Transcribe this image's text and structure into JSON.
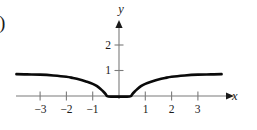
{
  "figure": {
    "panel_label": ")",
    "background_color": "#ffffff",
    "curve_color": "#0a0a0a",
    "axis_color": "#7b7b7b",
    "text_color": "#1a1a1a"
  },
  "chart_data": {
    "type": "line",
    "title": "",
    "xlabel": "x",
    "ylabel": "y",
    "grid": false,
    "legend": null,
    "xlim": [
      -3.9,
      4.3
    ],
    "ylim": [
      -0.5,
      2.9
    ],
    "x_ticks": [
      -3,
      -2,
      -1,
      1,
      2,
      3
    ],
    "x_tick_labels": [
      "−3",
      "−2",
      "−1",
      "1",
      "2",
      "3"
    ],
    "y_ticks": [
      1,
      2
    ],
    "y_tick_labels": [
      "1",
      "2"
    ],
    "series": [
      {
        "name": "curve",
        "x": [
          -3.9,
          -3.5,
          -3.0,
          -2.5,
          -2.0,
          -1.75,
          -1.5,
          -1.25,
          -1.0,
          -0.85,
          -0.7,
          -0.6,
          -0.5,
          -0.45,
          -0.3,
          0.0,
          0.3,
          0.45,
          0.5,
          0.6,
          0.7,
          0.85,
          1.0,
          1.25,
          1.5,
          1.75,
          2.0,
          2.5,
          3.0,
          3.5,
          3.9
        ],
        "y": [
          0.88,
          0.87,
          0.86,
          0.83,
          0.78,
          0.73,
          0.67,
          0.59,
          0.5,
          0.42,
          0.3,
          0.2,
          0.09,
          0.02,
          0.0,
          0.0,
          0.0,
          0.02,
          0.09,
          0.2,
          0.3,
          0.42,
          0.5,
          0.59,
          0.67,
          0.73,
          0.78,
          0.83,
          0.86,
          0.87,
          0.88
        ]
      }
    ],
    "annotations": []
  }
}
